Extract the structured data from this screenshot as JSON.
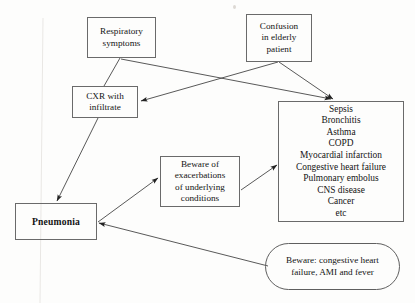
{
  "diagram": {
    "nodes": [
      {
        "id": "respiratory-symptoms",
        "name": "node-respiratory-symptoms",
        "shape": "rect",
        "lines": [
          "Respiratory",
          "symptoms"
        ],
        "x": 87,
        "y": 17,
        "w": 69,
        "h": 41
      },
      {
        "id": "confusion-elderly",
        "name": "node-confusion-in-elderly-patient",
        "shape": "rect",
        "lines": [
          "Confusion",
          "in elderly",
          "patient"
        ],
        "x": 246,
        "y": 14,
        "w": 66,
        "h": 48
      },
      {
        "id": "cxr-infiltrate",
        "name": "node-cxr-with-infiltrate",
        "shape": "rect",
        "lines": [
          "CXR with",
          "infiltrate"
        ],
        "x": 72,
        "y": 86,
        "w": 66,
        "h": 32
      },
      {
        "id": "differential-list",
        "name": "node-differential-diagnosis-list",
        "shape": "rect",
        "lines": [
          "Sepsis",
          "Bronchitis",
          "Asthma",
          "COPD",
          "Myocardial infarction",
          "Congestive heart failure",
          "Pulmonary embolus",
          "CNS disease",
          "Cancer",
          "etc"
        ],
        "x": 278,
        "y": 101,
        "w": 126,
        "h": 121
      },
      {
        "id": "beware-exacerbations",
        "name": "node-beware-of-exacerbations",
        "shape": "rect",
        "lines": [
          "Beware of",
          "exacerbations",
          "of underlying",
          "conditions"
        ],
        "x": 160,
        "y": 156,
        "w": 80,
        "h": 51
      },
      {
        "id": "pneumonia",
        "name": "node-pneumonia",
        "shape": "rect",
        "bold": true,
        "lines": [
          "Pneumonia"
        ],
        "x": 15,
        "y": 203,
        "w": 82,
        "h": 37
      },
      {
        "id": "beware-chf",
        "name": "node-beware-congestive-heart-failure-ami-fever",
        "shape": "stadium",
        "lines": [
          "Beware: congestive heart",
          "failure, AMI and fever"
        ],
        "x": 265,
        "y": 243,
        "w": 135,
        "h": 47
      }
    ],
    "edges": [
      {
        "id": "resp-to-cxr",
        "name": "edge-respiratory-symptoms-to-cxr",
        "from": "respiratory-symptoms",
        "to": "cxr-infiltrate",
        "points": "120,58 104,86",
        "arrow": false
      },
      {
        "id": "resp-to-list",
        "name": "edge-respiratory-symptoms-to-differential-list",
        "from": "respiratory-symptoms",
        "to": "differential-list",
        "points": "121,59 331,99",
        "arrow": true
      },
      {
        "id": "confusion-to-cxr",
        "name": "edge-confusion-to-cxr",
        "from": "confusion-elderly",
        "to": "cxr-infiltrate",
        "points": "278,62 141,101",
        "arrow": true
      },
      {
        "id": "confusion-to-list",
        "name": "edge-confusion-to-differential-list",
        "from": "confusion-elderly",
        "to": "differential-list",
        "points": "279,62 333,99",
        "arrow": true
      },
      {
        "id": "cxr-to-pneumonia",
        "name": "edge-cxr-to-pneumonia",
        "from": "cxr-infiltrate",
        "to": "pneumonia",
        "points": "98,118 57,201",
        "arrow": true
      },
      {
        "id": "pneumonia-to-beware-exac",
        "name": "edge-pneumonia-to-beware-of-exacerbations",
        "from": "pneumonia",
        "to": "beware-exacerbations",
        "points": "98,222 158,178",
        "arrow": true
      },
      {
        "id": "beware-exac-to-list",
        "name": "edge-beware-of-exacerbations-to-differential-list",
        "from": "beware-exacerbations",
        "to": "differential-list",
        "points": "241,190 277,165",
        "arrow": true
      },
      {
        "id": "beware-chf-to-pneumonia",
        "name": "edge-beware-chf-to-pneumonia",
        "from": "beware-chf",
        "to": "pneumonia",
        "points": "268,266 99,223",
        "arrow": true
      }
    ],
    "artifacts": {
      "scan_line_color": "#e9e7e4",
      "speck_color": "#ddd9d4"
    }
  }
}
